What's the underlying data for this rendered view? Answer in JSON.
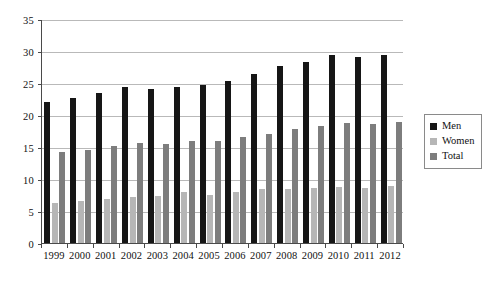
{
  "chart_data": {
    "type": "bar",
    "title": "",
    "subtitle": "",
    "xlabel": "",
    "ylabel": "",
    "ylim": [
      0,
      35
    ],
    "ytick_step": 5,
    "yticks": [
      0,
      5,
      10,
      15,
      20,
      25,
      30,
      35
    ],
    "ytick_labels": [
      "0",
      "5",
      "10",
      "15",
      "20",
      "25",
      "30",
      "35"
    ],
    "grid": true,
    "grid_axis": "y",
    "legend_position": "right",
    "categories": [
      "1999",
      "2000",
      "2001",
      "2002",
      "2003",
      "2004",
      "2005",
      "2006",
      "2007",
      "2008",
      "2009",
      "2010",
      "2011",
      "2012"
    ],
    "series": [
      {
        "name": "Men",
        "color": "#161616",
        "values": [
          22.0,
          22.7,
          23.4,
          24.4,
          24.1,
          24.3,
          24.7,
          25.3,
          26.4,
          27.7,
          28.3,
          29.4,
          29.0,
          29.4
        ]
      },
      {
        "name": "Women",
        "color": "#b6b6b6",
        "values": [
          6.3,
          6.6,
          6.9,
          7.2,
          7.4,
          7.9,
          7.5,
          7.9,
          8.4,
          8.5,
          8.6,
          8.7,
          8.6,
          8.9
        ]
      },
      {
        "name": "Total",
        "color": "#7d7d7d",
        "values": [
          14.2,
          14.6,
          15.1,
          15.7,
          15.5,
          15.9,
          15.9,
          16.5,
          17.1,
          17.8,
          18.3,
          18.8,
          18.6,
          18.9
        ]
      }
    ]
  },
  "legend": {
    "entries": [
      {
        "label": "Men",
        "color": "#161616"
      },
      {
        "label": "Women",
        "color": "#b6b6b6"
      },
      {
        "label": "Total",
        "color": "#7d7d7d"
      }
    ]
  },
  "axes": {
    "y_max_label": "35",
    "y_min_label": "0"
  }
}
